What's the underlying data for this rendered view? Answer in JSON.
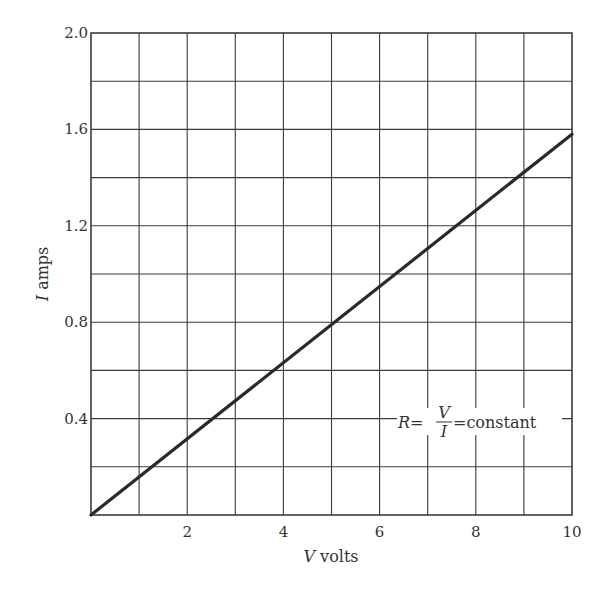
{
  "chart_data": {
    "type": "line",
    "title": "",
    "xlabel": "V volts",
    "ylabel": "I amps",
    "xlim": [
      0,
      10
    ],
    "ylim": [
      0,
      2.0
    ],
    "grid": true,
    "grid_step_x": 1,
    "grid_step_y": 0.2,
    "x_ticks": [
      2,
      4,
      6,
      8,
      10
    ],
    "x_tick_labels": [
      "2",
      "4",
      "6",
      "8",
      "10"
    ],
    "y_ticks": [
      0.4,
      0.8,
      1.2,
      1.6,
      2.0
    ],
    "y_tick_labels": [
      "0.4",
      "0.8",
      "1.2",
      "1.6",
      "2.0"
    ],
    "series": [
      {
        "name": "I vs V",
        "x": [
          0,
          10
        ],
        "y": [
          0,
          1.58
        ]
      }
    ],
    "annotations": [
      {
        "text": "R = V/I = constant",
        "x": 8.3,
        "y": 0.4
      }
    ],
    "legend": null
  },
  "labels": {
    "xlabel_var": "V",
    "xlabel_unit": " volts",
    "ylabel_var": "I",
    "ylabel_unit": " amps",
    "annot_R": "R",
    "annot_eq1": "=",
    "annot_num": "V",
    "annot_den": "I",
    "annot_eq2": "=",
    "annot_word": "constant"
  },
  "colors": {
    "grid": "#3a3a3a",
    "line": "#2a2a2a",
    "text": "#333333"
  }
}
